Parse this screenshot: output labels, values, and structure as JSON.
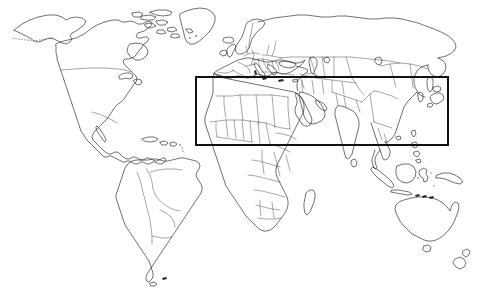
{
  "figure": {
    "kind": "world-map-outline",
    "width": 482,
    "height": 301,
    "background_color": "#ffffff",
    "coastline_color": "#1a1a1a",
    "border_color": "#3a3a3a",
    "roi_color": "#111111",
    "title": "",
    "caption": ""
  },
  "chart_data": {
    "type": "map",
    "title": "",
    "projection": "equirectangular",
    "background": "white",
    "grid": false,
    "legend": false,
    "xlabel": "",
    "ylabel": "",
    "xlim": [
      -180,
      180
    ],
    "ylim": [
      -60,
      84
    ],
    "layers": [
      {
        "name": "coastlines",
        "style": "thin black outline",
        "fill": "none"
      },
      {
        "name": "country_borders",
        "style": "thin gray line",
        "fill": "none"
      },
      {
        "name": "region_of_interest_rectangle",
        "style": "solid black rectangle",
        "fill": "none"
      }
    ],
    "region_of_interest": {
      "label": "",
      "pixel_bounds": {
        "x": 196,
        "y": 77,
        "width": 252,
        "height": 68
      },
      "approx_geographic_bounds": {
        "west_longitude": -33,
        "east_longitude": 155,
        "north_latitude": 46,
        "south_latitude": 9
      },
      "covers": [
        "North Africa",
        "Sahel",
        "Mediterranean rim",
        "Middle East",
        "Arabian Peninsula",
        "Central Asia",
        "South Asia",
        "Southeast Asia",
        "Southern China"
      ]
    },
    "continents_visible": [
      "North America",
      "South America",
      "Europe",
      "Africa",
      "Asia",
      "Australia",
      "Greenland"
    ],
    "notable_features": [
      "Alaska and dotted Aleutian Island chain",
      "Greenland and Canadian Arctic archipelago",
      "Madagascar",
      "Japan archipelago",
      "Indonesian archipelago",
      "New Zealand",
      "Sri Lanka",
      "Tierra del Fuego"
    ]
  },
  "roi": {
    "x": 196,
    "y": 77,
    "width": 252,
    "height": 68
  }
}
